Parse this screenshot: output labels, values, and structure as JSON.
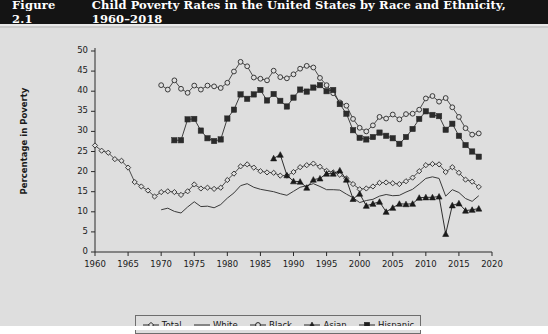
{
  "figure": {
    "label": "Figure 2.1",
    "title": "Child Poverty Rates in the United States by Race and Ethnicity, 1960–2018",
    "header_bg": "#141414",
    "header_fg": "#ffffff",
    "panel_bg": "#dedede",
    "ink": "#1a1a1a"
  },
  "chart_data": {
    "type": "line",
    "title": "Child Poverty Rates in the United States by Race and Ethnicity, 1960–2018",
    "xlabel": "",
    "ylabel": "Percentage in Poverty",
    "xlim": [
      1958,
      2021
    ],
    "ylim": [
      0,
      50
    ],
    "ytick_values": [
      0,
      5,
      10,
      15,
      20,
      25,
      30,
      35,
      40,
      45,
      50
    ],
    "xtick_values": [
      1960,
      1965,
      1970,
      1975,
      1980,
      1985,
      1990,
      1995,
      2000,
      2005,
      2010,
      2015,
      2020
    ],
    "grid": false,
    "legend_position": "bottom-center",
    "series": [
      {
        "name": "Total",
        "marker": "open-diamond",
        "color": "#3a3a3a",
        "x": [
          1960,
          1961,
          1962,
          1963,
          1964,
          1965,
          1966,
          1967,
          1968,
          1969,
          1970,
          1971,
          1972,
          1973,
          1974,
          1975,
          1976,
          1977,
          1978,
          1979,
          1980,
          1981,
          1982,
          1983,
          1984,
          1985,
          1986,
          1987,
          1988,
          1989,
          1990,
          1991,
          1992,
          1993,
          1994,
          1995,
          1996,
          1997,
          1998,
          1999,
          2000,
          2001,
          2002,
          2003,
          2004,
          2005,
          2006,
          2007,
          2008,
          2009,
          2010,
          2011,
          2012,
          2013,
          2014,
          2015,
          2016,
          2017,
          2018
        ],
        "y": [
          26.5,
          25.2,
          24.7,
          23.1,
          22.7,
          21.0,
          17.4,
          16.3,
          15.3,
          13.8,
          14.9,
          15.1,
          14.9,
          14.2,
          15.1,
          16.8,
          15.8,
          16.0,
          15.7,
          16.0,
          17.9,
          19.5,
          21.3,
          21.8,
          21.0,
          20.1,
          19.8,
          19.7,
          19.0,
          19.0,
          19.9,
          21.1,
          21.6,
          22.0,
          21.2,
          20.2,
          19.8,
          19.2,
          18.3,
          16.9,
          15.6,
          15.8,
          16.3,
          17.2,
          17.3,
          17.1,
          16.9,
          17.6,
          18.5,
          20.1,
          21.6,
          21.9,
          21.8,
          19.9,
          21.1,
          19.7,
          18.0,
          17.5,
          16.2
        ]
      },
      {
        "name": "White",
        "marker": "none",
        "color": "#3a3a3a",
        "x": [
          1970,
          1971,
          1972,
          1973,
          1974,
          1975,
          1976,
          1977,
          1978,
          1979,
          1980,
          1981,
          1982,
          1983,
          1984,
          1985,
          1986,
          1987,
          1988,
          1989,
          1990,
          1991,
          1992,
          1993,
          1994,
          1995,
          1996,
          1997,
          1998,
          1999,
          2000,
          2001,
          2002,
          2003,
          2004,
          2005,
          2006,
          2007,
          2008,
          2009,
          2010,
          2011,
          2012,
          2013,
          2014,
          2015,
          2016,
          2017,
          2018
        ],
        "y": [
          10.5,
          10.9,
          10.1,
          9.7,
          11.2,
          12.5,
          11.3,
          11.4,
          11.0,
          11.8,
          13.4,
          14.7,
          16.5,
          17.0,
          16.1,
          15.6,
          15.3,
          15.0,
          14.5,
          14.1,
          15.1,
          16.1,
          16.5,
          17.0,
          16.3,
          15.5,
          15.5,
          15.4,
          14.4,
          13.5,
          12.3,
          12.8,
          13.1,
          13.9,
          14.3,
          14.0,
          14.1,
          14.9,
          15.6,
          16.9,
          18.3,
          18.7,
          18.3,
          13.9,
          15.5,
          14.8,
          13.3,
          12.6,
          14.0
        ]
      },
      {
        "name": "Black",
        "marker": "open-circle",
        "color": "#3a3a3a",
        "x": [
          1970,
          1971,
          1972,
          1973,
          1974,
          1975,
          1976,
          1977,
          1978,
          1979,
          1980,
          1981,
          1982,
          1983,
          1984,
          1985,
          1986,
          1987,
          1988,
          1989,
          1990,
          1991,
          1992,
          1993,
          1994,
          1995,
          1996,
          1997,
          1998,
          1999,
          2000,
          2001,
          2002,
          2003,
          2004,
          2005,
          2006,
          2007,
          2008,
          2009,
          2010,
          2011,
          2012,
          2013,
          2014,
          2015,
          2016,
          2017,
          2018
        ],
        "y": [
          41.5,
          40.4,
          42.7,
          40.6,
          39.6,
          41.4,
          40.4,
          41.4,
          41.2,
          40.8,
          42.1,
          44.9,
          47.3,
          46.2,
          43.4,
          43.1,
          42.7,
          45.1,
          43.5,
          43.2,
          44.2,
          45.6,
          46.3,
          45.9,
          43.3,
          41.5,
          39.5,
          37.2,
          36.4,
          33.1,
          30.9,
          30.0,
          31.5,
          33.6,
          33.2,
          34.2,
          33.0,
          34.3,
          34.4,
          35.4,
          38.2,
          38.8,
          37.4,
          38.3,
          36.0,
          33.6,
          30.8,
          29.2,
          29.5
        ]
      },
      {
        "name": "Asian",
        "marker": "filled-triangle",
        "color": "#1a1a1a",
        "x": [
          1987,
          1988,
          1989,
          1990,
          1991,
          1992,
          1993,
          1994,
          1995,
          1996,
          1997,
          1998,
          1999,
          2000,
          2001,
          2002,
          2003,
          2004,
          2005,
          2006,
          2007,
          2008,
          2009,
          2010,
          2011,
          2012,
          2013,
          2014,
          2015,
          2016,
          2017,
          2018
        ],
        "y": [
          23.3,
          24.2,
          19.1,
          17.6,
          17.5,
          16.0,
          18.0,
          18.3,
          19.5,
          19.5,
          20.3,
          18.0,
          13.2,
          14.5,
          11.5,
          12.0,
          12.5,
          10.0,
          11.0,
          12.0,
          11.9,
          12.0,
          13.5,
          13.6,
          13.6,
          13.8,
          4.5,
          11.6,
          12.1,
          10.3,
          10.5,
          10.8
        ]
      },
      {
        "name": "Hispanic",
        "marker": "filled-square",
        "color": "#2b2b2b",
        "x": [
          1972,
          1973,
          1974,
          1975,
          1976,
          1977,
          1978,
          1979,
          1980,
          1981,
          1982,
          1983,
          1984,
          1985,
          1986,
          1987,
          1988,
          1989,
          1990,
          1991,
          1992,
          1993,
          1994,
          1995,
          1996,
          1997,
          1998,
          1999,
          2000,
          2001,
          2002,
          2003,
          2004,
          2005,
          2006,
          2007,
          2008,
          2009,
          2010,
          2011,
          2012,
          2013,
          2014,
          2015,
          2016,
          2017,
          2018
        ],
        "y": [
          27.8,
          27.8,
          33.0,
          33.1,
          30.2,
          28.3,
          27.6,
          28.0,
          33.2,
          35.4,
          39.2,
          38.1,
          39.2,
          40.3,
          37.7,
          39.3,
          37.6,
          36.2,
          38.4,
          40.4,
          39.9,
          40.9,
          41.5,
          40.0,
          40.3,
          36.8,
          34.4,
          30.3,
          28.4,
          28.0,
          28.6,
          29.7,
          28.9,
          28.3,
          26.9,
          28.6,
          30.6,
          33.1,
          35.0,
          34.1,
          33.8,
          30.4,
          31.9,
          28.9,
          26.6,
          25.0,
          23.7
        ]
      }
    ]
  },
  "legend": {
    "items": [
      {
        "label": "Total",
        "marker": "open-diamond"
      },
      {
        "label": "White",
        "marker": "none"
      },
      {
        "label": "Black",
        "marker": "open-circle"
      },
      {
        "label": "Asian",
        "marker": "filled-triangle"
      },
      {
        "label": "Hispanic",
        "marker": "filled-square"
      }
    ]
  }
}
